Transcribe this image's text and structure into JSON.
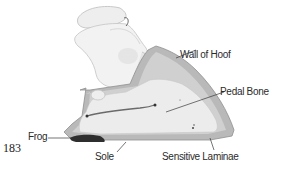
{
  "figure": {
    "number": "183"
  },
  "labels": {
    "wall_of_hoof": "Wall of Hoof",
    "pedal_bone": "Pedal Bone",
    "frog": "Frog",
    "sole": "Sole",
    "sensitive_laminae": "Sensitive Laminae"
  },
  "colors": {
    "hoof_wall": "#b9b9b9",
    "laminae": "#d0d0d0",
    "bone": "#ececec",
    "frog": "#2e2e2e",
    "text": "#2b2b2b"
  }
}
